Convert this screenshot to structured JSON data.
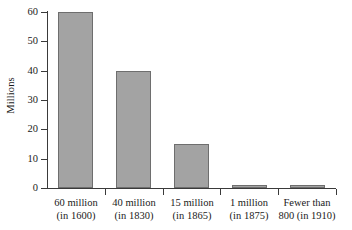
{
  "chart_data": {
    "type": "bar",
    "title": "",
    "xlabel": "",
    "ylabel": "Millions",
    "ylim": [
      0,
      60
    ],
    "yticks": [
      0,
      10,
      20,
      30,
      40,
      50,
      60
    ],
    "ytick_labels": [
      "0",
      "10",
      "20",
      "30",
      "40",
      "50",
      "60"
    ],
    "grid": false,
    "legend": null,
    "categories": [
      "60 million\n(in 1600)",
      "40 million\n(in 1830)",
      "15 million\n(in 1865)",
      "1 million\n(in 1875)",
      "Fewer than\n800 (in 1910)"
    ],
    "category_lines": [
      [
        "60 million",
        "(in 1600)"
      ],
      [
        "40 million",
        "(in 1830)"
      ],
      [
        "15 million",
        "(in 1865)"
      ],
      [
        "1 million",
        "(in 1875)"
      ],
      [
        "Fewer than",
        "800 (in 1910)"
      ]
    ],
    "values": [
      60,
      40,
      15,
      1,
      0.3
    ],
    "value_labels": [
      "60 million",
      "40 million",
      "15 million",
      "1 million",
      "Fewer than 800"
    ],
    "years": [
      "1600",
      "1830",
      "1865",
      "1875",
      "1910"
    ],
    "bar_color": "#a3a3a3",
    "bar_edge_color": "#6e6e6e",
    "axis_color": "#3a3a3a",
    "background": "#ffffff"
  }
}
